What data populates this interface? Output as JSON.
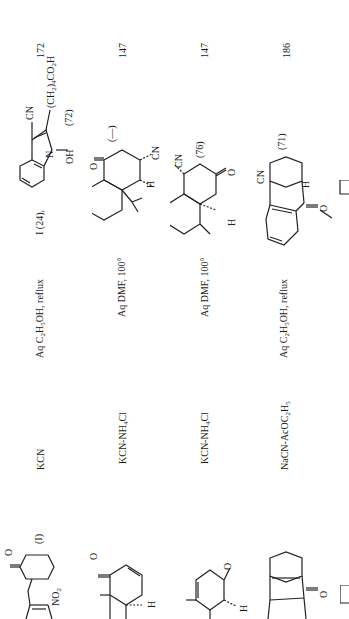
{
  "document": {
    "orientation": "rotated-90-clockwise",
    "table": {
      "columns": [
        "Substrate",
        "Reagent",
        "Conditions",
        "Product(s) (Yield %)",
        "Refs."
      ],
      "rows": [
        {
          "substrate_label": "(I)",
          "substrate_groups": [
            "O",
            "NO2"
          ],
          "reagent": "KCN",
          "conditions": "Aq C2H5OH, reflux",
          "product_prefix": "I (24),",
          "product_groups": [
            "CN",
            "(CH2)4CO2H",
            "N",
            "OH"
          ],
          "product_yield": "(72)",
          "ref": "172"
        },
        {
          "substrate_groups": [
            "O",
            "H"
          ],
          "reagent": "KCN-NH4Cl",
          "conditions": "Aq DMF, 100°",
          "product_groups": [
            "O",
            "CN",
            "H"
          ],
          "product_yield": "(—)",
          "ref": "147"
        },
        {
          "substrate_groups": [
            "O",
            "H"
          ],
          "reagent": "KCN-NH4Cl",
          "conditions": "Aq DMF, 100°",
          "product_groups": [
            "CN",
            "O",
            "H"
          ],
          "product_yield": "(76)",
          "ref": "147"
        },
        {
          "substrate_groups": [
            "O"
          ],
          "reagent": "NaCN-AcOC2H5",
          "conditions": "Aq C2H5OH, reflux",
          "product_groups": [
            "CN",
            "H",
            "O"
          ],
          "product_yield": "(71)",
          "ref": "186"
        }
      ]
    },
    "text": {
      "r1_reagent": "KCN",
      "r1_cond_a": "Aq C",
      "r1_cond_sub1": "2",
      "r1_cond_b": "H",
      "r1_cond_sub2": "5",
      "r1_cond_c": "OH, reflux",
      "r1_prefix": "I  (24),",
      "r1_yield": "(72)",
      "r1_ref": "172",
      "r1_sub_label": "(I)",
      "r2_reagent_a": "KCN-NH",
      "r2_reagent_sub": "4",
      "r2_reagent_b": "Cl",
      "r2_cond": "Aq DMF, 100°",
      "r2_yield": "(—)",
      "r2_ref": "147",
      "r3_reagent_a": "KCN-NH",
      "r3_reagent_sub": "4",
      "r3_reagent_b": "Cl",
      "r3_cond": "Aq DMF, 100°",
      "r3_yield": "(76)",
      "r3_ref": "147",
      "r4_reagent_a": "NaCN-AcOC",
      "r4_reagent_sub1": "2",
      "r4_reagent_b": "H",
      "r4_reagent_sub2": "5",
      "r4_cond_a": "Aq C",
      "r4_cond_sub1": "2",
      "r4_cond_b": "H",
      "r4_cond_sub2": "5",
      "r4_cond_c": "OH, reflux",
      "r4_yield": "(71)",
      "r4_ref": "186"
    },
    "atoms": {
      "O": "O",
      "NO2": "NO",
      "NO2_sub": "2",
      "CN": "CN",
      "H": "H",
      "N": "N",
      "OH": "OH",
      "chain_a": "(CH",
      "chain_sub1": "2",
      "chain_b": ")",
      "chain_sub2": "4",
      "chain_c": "CO",
      "chain_sub3": "2",
      "chain_d": "H"
    }
  }
}
